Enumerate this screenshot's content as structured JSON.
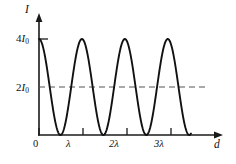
{
  "figure": {
    "name": "intensity-vs-path-difference",
    "background_color": "#ffffff",
    "line_color": "#111111",
    "dashed_color": "#555555"
  },
  "axes": {
    "y_axis_label": "I",
    "x_axis_label": "d",
    "origin_label": "0"
  },
  "y_ticks": [
    {
      "value": 4,
      "prefix": "4",
      "symbol": "I",
      "subscript": "0",
      "text": "4I0"
    },
    {
      "value": 2,
      "prefix": "2",
      "symbol": "I",
      "subscript": "0",
      "text": "2I0"
    }
  ],
  "x_ticks": [
    {
      "value": 0,
      "label": "0"
    },
    {
      "value": 1,
      "label": "λ"
    },
    {
      "value": 2,
      "label": "2λ"
    },
    {
      "value": 3,
      "label": "3λ"
    }
  ],
  "reference_line": {
    "label": "2I0",
    "value": 2,
    "style": "dashed"
  },
  "chart_data": {
    "type": "line",
    "title": "",
    "subtitle": "",
    "xlabel": "d",
    "ylabel": "I",
    "xlim": [
      0,
      4.1
    ],
    "ylim": [
      0,
      4.6
    ],
    "grid": false,
    "legend": null,
    "x_tick_values": [
      0,
      1,
      2,
      3
    ],
    "x_tick_labels": [
      "0",
      "λ",
      "2λ",
      "3λ"
    ],
    "y_tick_values": [
      2,
      4
    ],
    "y_tick_labels": [
      "2I0",
      "4I0"
    ],
    "annotations": [
      {
        "type": "hline",
        "y": 2,
        "label": "2I0",
        "style": "dashed"
      }
    ],
    "series": [
      {
        "name": "I(d) = 4I0 cos^2(pi d / lambda)",
        "x_unit": "lambda",
        "y_unit": "I0",
        "x_range": [
          0,
          3.54
        ],
        "period": 1,
        "amplitude": 4,
        "mean": 2,
        "maxima_x": [
          0,
          1,
          2,
          3
        ],
        "maxima_y": [
          4,
          4,
          4,
          4
        ],
        "minima_x": [
          0.5,
          1.5,
          2.5,
          3.5
        ],
        "minima_y": [
          0,
          0,
          0,
          0
        ],
        "endpoint_x": 3.54,
        "endpoint_y": 1.0,
        "x": [
          0,
          0.1,
          0.2,
          0.3,
          0.4,
          0.5,
          0.6,
          0.7,
          0.8,
          0.9,
          1.0,
          1.1,
          1.2,
          1.3,
          1.4,
          1.5,
          1.6,
          1.7,
          1.8,
          1.9,
          2.0,
          2.1,
          2.2,
          2.3,
          2.4,
          2.5,
          2.6,
          2.7,
          2.8,
          2.9,
          3.0,
          3.1,
          3.2,
          3.3,
          3.4,
          3.5,
          3.54
        ],
        "values": [
          4.0,
          3.62,
          2.62,
          1.38,
          0.38,
          0.0,
          0.38,
          1.38,
          2.62,
          3.62,
          4.0,
          3.62,
          2.62,
          1.38,
          0.38,
          0.0,
          0.38,
          1.38,
          2.62,
          3.62,
          4.0,
          3.62,
          2.62,
          1.38,
          0.38,
          0.0,
          0.38,
          1.38,
          2.62,
          3.62,
          4.0,
          3.62,
          2.62,
          1.38,
          0.38,
          0.0,
          0.1
        ]
      }
    ]
  }
}
